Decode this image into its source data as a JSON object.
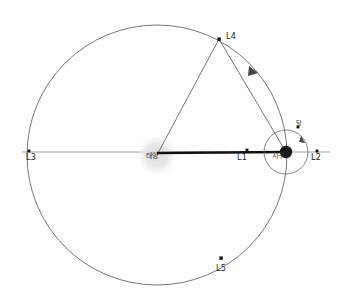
{
  "diagram": {
    "colors": {
      "background": "#ffffff",
      "orbit_stroke": "#555555",
      "triangle_stroke": "#666666",
      "axis_stroke": "#777777",
      "sunline_stroke": "#111111",
      "sun_glow": "#e6e6e6",
      "earth_fill": "#1a1a1a",
      "point_fill": "#111111",
      "label_color": "#222222"
    },
    "bodies": {
      "sun": {
        "label": "태양",
        "cx": 157,
        "cy": 155,
        "glow_radius": 19
      },
      "earth": {
        "label": "지구",
        "cx": 286,
        "cy": 152,
        "radius": 6
      },
      "moon": {
        "label": "달",
        "cx": 298,
        "cy": 127,
        "radius": 1.6,
        "orbit_radius": 22
      }
    },
    "orbit": {
      "cx": 157,
      "cy": 155,
      "radius": 130
    },
    "lagrange_points": [
      {
        "name": "L1",
        "x": 247,
        "y": 150
      },
      {
        "name": "L2",
        "x": 317,
        "y": 151
      },
      {
        "name": "L3",
        "x": 29,
        "y": 151
      },
      {
        "name": "L4",
        "x": 219,
        "y": 39
      },
      {
        "name": "L5",
        "x": 221,
        "y": 258
      }
    ],
    "connections": [
      {
        "from": "sun",
        "to": "L4"
      },
      {
        "from": "L4",
        "to": "earth"
      },
      {
        "from": "sun",
        "to": "earth",
        "style": "thick"
      },
      {
        "from": "L3",
        "to": "L2",
        "style": "axis"
      }
    ],
    "arrow": {
      "x": 252,
      "y": 72,
      "direction": "toward-earth"
    }
  }
}
